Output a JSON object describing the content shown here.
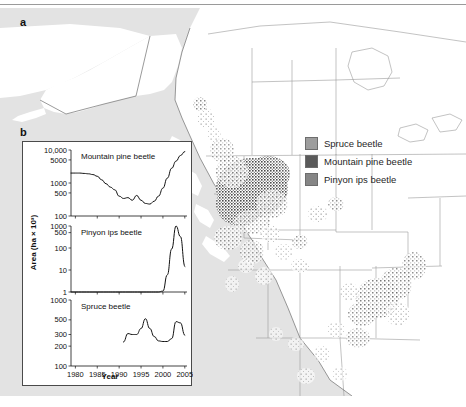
{
  "figure": {
    "panels": [
      {
        "letter": "a",
        "type": "map"
      },
      {
        "letter": "b",
        "type": "chart"
      }
    ]
  },
  "map": {
    "name": "western-north-america-bark-beetle-outbreak-map",
    "ocean_color": "#e3e3e3",
    "land_color": "#ffffff",
    "border_color": "#9b9b9b",
    "coast_color": "#6f6f6f"
  },
  "legend": {
    "position": "map-upper-right",
    "items": [
      {
        "label": "Spruce beetle",
        "color": "#9d9d9d"
      },
      {
        "label": "Mountain pine beetle",
        "color": "#5a5a5a"
      },
      {
        "label": "Pinyon ips beetle",
        "color": "#868686"
      }
    ]
  },
  "chart_data": [
    {
      "type": "line",
      "title": "Mountain pine beetle",
      "xlabel": "",
      "ylabel": "Area (ha × 10³)",
      "yscale": "log",
      "ylim": [
        100,
        10000
      ],
      "yticks": [
        100,
        500,
        1000,
        5000,
        10000
      ],
      "ytick_labels": [
        "100",
        "500",
        "1000",
        "5000",
        "10,000"
      ],
      "xlim": [
        1979,
        2005.5
      ],
      "xticks": [
        1980,
        1985,
        1990,
        1995,
        2000,
        2005
      ],
      "grid": false,
      "legend": "none",
      "x": [
        1979,
        1980,
        1981,
        1982,
        1983,
        1984,
        1985,
        1986,
        1987,
        1988,
        1989,
        1990,
        1991,
        1992,
        1993,
        1994,
        1995,
        1996,
        1997,
        1998,
        1999,
        2000,
        2001,
        2002,
        2003,
        2004,
        2005
      ],
      "values": [
        2000,
        2000,
        2000,
        1950,
        1900,
        1800,
        1600,
        1250,
        950,
        750,
        620,
        400,
        340,
        360,
        300,
        420,
        300,
        240,
        230,
        280,
        400,
        700,
        1400,
        2800,
        4600,
        6800,
        9000
      ]
    },
    {
      "type": "line",
      "title": "Pinyon ips beetle",
      "xlabel": "",
      "ylabel": "Area (ha × 10³)",
      "yscale": "log",
      "ylim": [
        1,
        1000
      ],
      "yticks": [
        1,
        10,
        100,
        500,
        1000
      ],
      "ytick_labels": [
        "1",
        "10",
        "100",
        "500",
        "1000"
      ],
      "xlim": [
        1979,
        2005.5
      ],
      "xticks": [
        1980,
        1985,
        1990,
        1995,
        2000,
        2005
      ],
      "grid": false,
      "legend": "none",
      "x": [
        1979,
        1985,
        1990,
        1995,
        1999,
        2000,
        2001,
        2002,
        2003,
        2004,
        2005
      ],
      "values": [
        1,
        1,
        1,
        1,
        1,
        1.1,
        6,
        90,
        1000,
        330,
        14
      ]
    },
    {
      "type": "line",
      "title": "Spruce beetle",
      "xlabel": "Year",
      "ylabel": "Area (ha × 10³)",
      "yscale": "log",
      "ylim": [
        100,
        1000
      ],
      "yticks": [
        100,
        200,
        300,
        500,
        1000
      ],
      "ytick_labels": [
        "100",
        "200",
        "300",
        "500",
        "1000"
      ],
      "xlim": [
        1979,
        2005.5
      ],
      "xticks": [
        1980,
        1985,
        1990,
        1995,
        2000,
        2005
      ],
      "grid": false,
      "legend": "none",
      "x": [
        1991,
        1992,
        1993,
        1994,
        1995,
        1996,
        1997,
        1998,
        1999,
        2000,
        2001,
        2002,
        2003,
        2004,
        2005
      ],
      "values": [
        230,
        310,
        300,
        300,
        370,
        520,
        370,
        280,
        240,
        235,
        235,
        260,
        470,
        450,
        290
      ]
    }
  ],
  "axes": {
    "ylabel": "Area (ha × 10³)",
    "xlabel": "Year",
    "xtick_labels": [
      "1980",
      "1985",
      "1990",
      "1995",
      "2000",
      "2005"
    ]
  }
}
